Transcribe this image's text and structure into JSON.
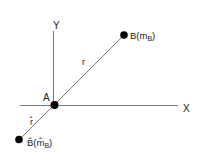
{
  "diagram": {
    "axes": {
      "x_label": "X",
      "y_label": "Y"
    },
    "points": {
      "origin": {
        "label": "A"
      },
      "b": {
        "label_main": "B(m",
        "label_sub": "B",
        "label_close": ")"
      },
      "b_hat": {
        "label_main": "B̂(m̂",
        "label_sub": "B",
        "label_close": ")"
      }
    },
    "segments": {
      "r": {
        "label": "r"
      },
      "r_hat": {
        "label": "r̂"
      }
    },
    "colors": {
      "line": "#444444",
      "point": "#000000",
      "text": "#222222"
    }
  }
}
